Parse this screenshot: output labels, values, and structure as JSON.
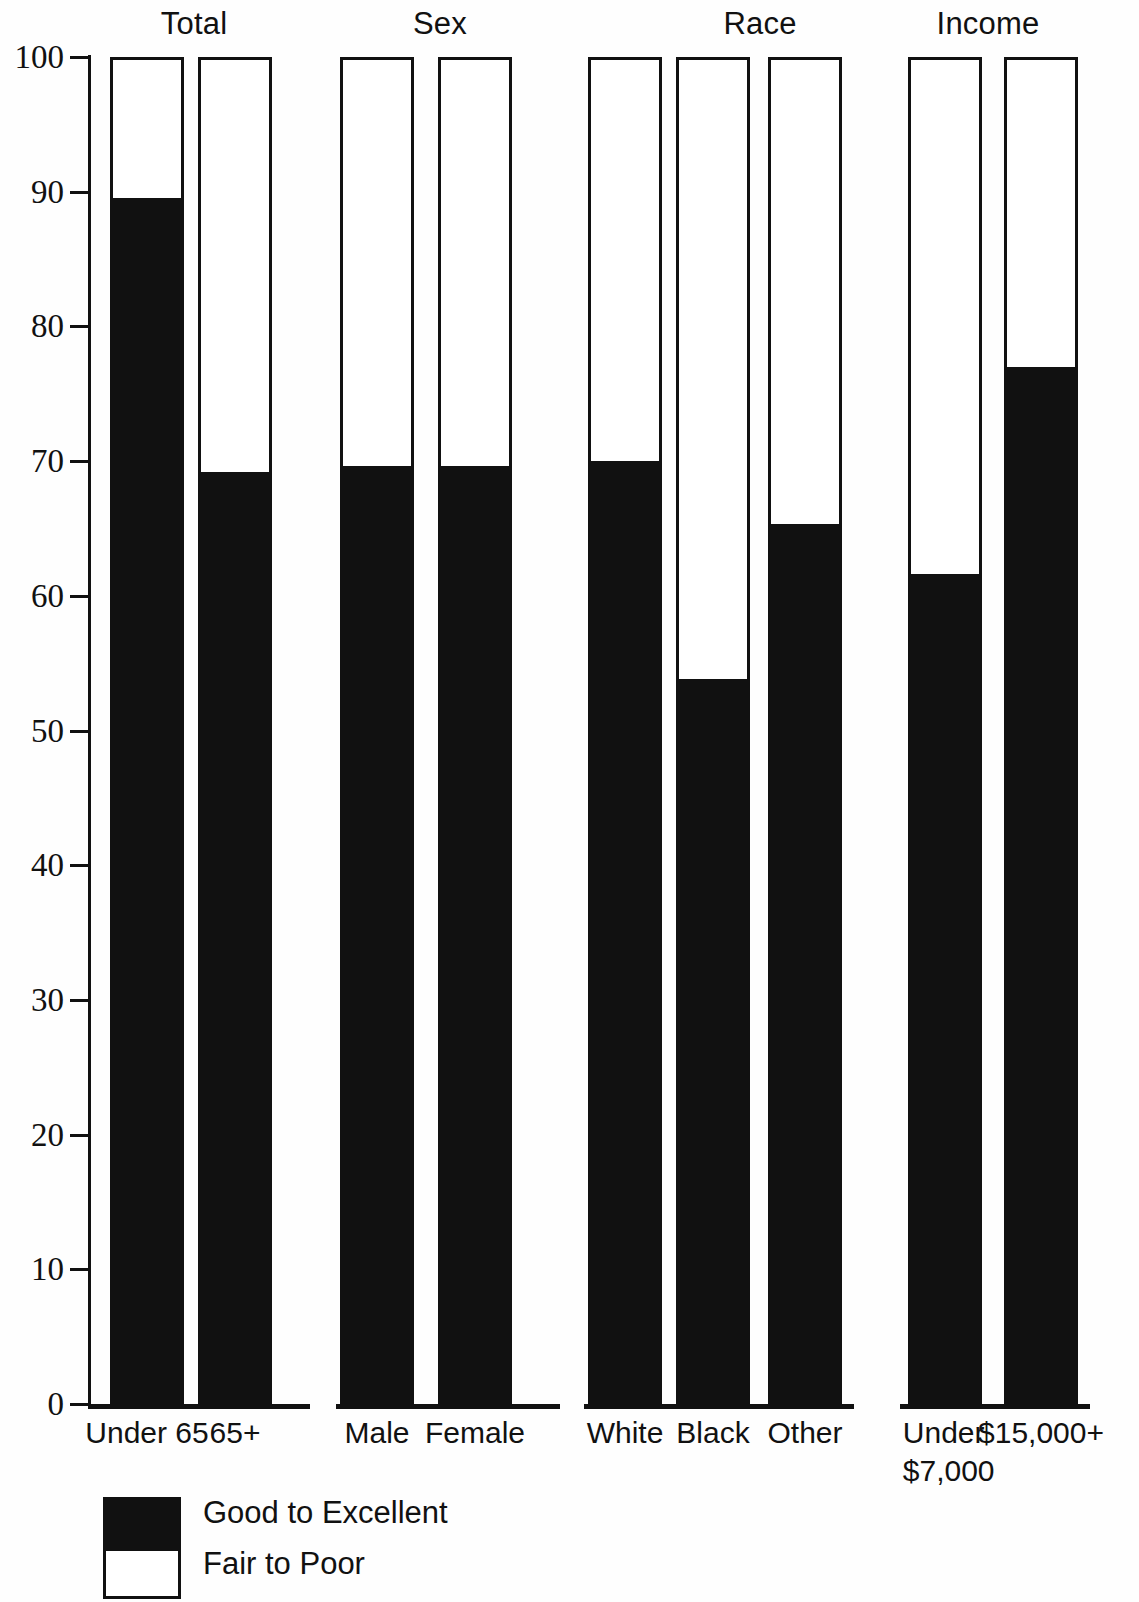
{
  "chart_data": {
    "type": "bar",
    "subtype": "stacked-100-percent",
    "title": "",
    "xlabel": "",
    "ylabel": "",
    "ylim": [
      0,
      100
    ],
    "y_ticks": [
      0,
      10,
      20,
      30,
      40,
      50,
      60,
      70,
      80,
      90,
      100
    ],
    "y_tick_labels": [
      "0",
      "10",
      "20",
      "30",
      "40",
      "50",
      "60",
      "70",
      "80",
      "90",
      "100"
    ],
    "grid": false,
    "legend_position": "bottom-left",
    "groups": [
      {
        "name": "Total",
        "categories": [
          "Under 65",
          "65+"
        ],
        "values": [
          89.3,
          69.0
        ]
      },
      {
        "name": "Sex",
        "categories": [
          "Male",
          "Female"
        ],
        "values": [
          69.4,
          69.4
        ]
      },
      {
        "name": "Race",
        "categories": [
          "White",
          "Black",
          "Other"
        ],
        "values": [
          69.8,
          53.6,
          65.1
        ]
      },
      {
        "name": "Income",
        "categories": [
          "Under $7,000",
          "$15,000+"
        ],
        "values": [
          61.4,
          76.8
        ]
      }
    ],
    "series": [
      {
        "name": "Good to Excellent",
        "color": "#111111",
        "values": [
          89.3,
          69.0,
          69.4,
          69.4,
          69.8,
          53.6,
          65.1,
          61.4,
          76.8
        ]
      },
      {
        "name": "Fair to Poor",
        "color": "#ffffff",
        "values": [
          10.7,
          31.0,
          30.6,
          30.6,
          30.2,
          46.4,
          34.9,
          38.6,
          23.2
        ]
      }
    ],
    "categories": [
      "Under 65",
      "65+",
      "Male",
      "Female",
      "White",
      "Black",
      "Other",
      "Under $7,000",
      "$15,000+"
    ]
  },
  "axis": {
    "ticks": [
      {
        "label": "100",
        "value": 100
      },
      {
        "label": "90",
        "value": 90
      },
      {
        "label": "80",
        "value": 80
      },
      {
        "label": "70",
        "value": 70
      },
      {
        "label": "60",
        "value": 60
      },
      {
        "label": "50",
        "value": 50
      },
      {
        "label": "40",
        "value": 40
      },
      {
        "label": "30",
        "value": 30
      },
      {
        "label": "20",
        "value": 20
      },
      {
        "label": "10",
        "value": 10
      },
      {
        "label": "0",
        "value": 0
      }
    ]
  },
  "groups": [
    {
      "title": "Total"
    },
    {
      "title": "Sex"
    },
    {
      "title": "Race"
    },
    {
      "title": "Income"
    }
  ],
  "bars": [
    {
      "label": "Under 65",
      "label_line2": "",
      "value": 89.3
    },
    {
      "label": "65+",
      "label_line2": "",
      "value": 69.0
    },
    {
      "label": "Male",
      "label_line2": "",
      "value": 69.4
    },
    {
      "label": "Female",
      "label_line2": "",
      "value": 69.4
    },
    {
      "label": "White",
      "label_line2": "",
      "value": 69.8
    },
    {
      "label": "Black",
      "label_line2": "",
      "value": 53.6
    },
    {
      "label": "Other",
      "label_line2": "",
      "value": 65.1
    },
    {
      "label": "Under",
      "label_line2": "$7,000",
      "value": 61.4
    },
    {
      "label": "$15,000+",
      "label_line2": "",
      "value": 76.8
    }
  ],
  "legend": {
    "items": [
      {
        "label": "Good to Excellent",
        "swatch": "solid"
      },
      {
        "label": "Fair to Poor",
        "swatch": "hollow"
      }
    ]
  },
  "colors": {
    "ink": "#111111",
    "paper": "#ffffff",
    "good_to_excellent": "#111111",
    "fair_to_poor": "#ffffff"
  }
}
